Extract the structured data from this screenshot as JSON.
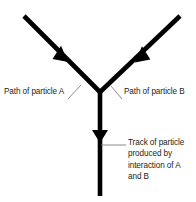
{
  "diagram": {
    "stroke_color": "#000000",
    "text_color": "#231f20",
    "background_color": "#ffffff",
    "leader_color": "#6d6e71",
    "labels": {
      "particle_a": "Path of particle A",
      "particle_b": "Path of particle B",
      "product_track_lines": [
        "Track of particle",
        "produced by",
        "interaction of A",
        "and B"
      ]
    },
    "icons": {
      "arrow_a": "arrowhead-down-right-icon",
      "arrow_b": "arrowhead-down-left-icon",
      "arrow_product": "arrowhead-down-icon"
    }
  }
}
